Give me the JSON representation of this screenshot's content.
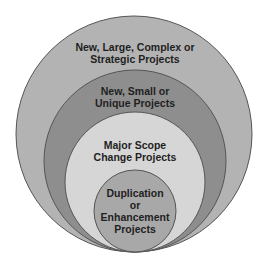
{
  "diagram": {
    "type": "nested-circles",
    "circles": [
      {
        "label_lines": [
          "New, Large, Complex or",
          "Strategic Projects"
        ],
        "fill": "#b3b3b3",
        "cx": 134,
        "cy": 134,
        "r": 118
      },
      {
        "label_lines": [
          "New, Small or",
          "Unique Projects"
        ],
        "fill": "#8e8e8e",
        "cx": 135,
        "cy": 161,
        "r": 91
      },
      {
        "label_lines": [
          "Major Scope",
          "Change Projects"
        ],
        "fill": "#d6d6d6",
        "cx": 135,
        "cy": 182,
        "r": 70
      },
      {
        "label_lines": [
          "Duplication",
          "or",
          "Enhancement",
          "Projects"
        ],
        "fill": "#a8a8a8",
        "cx": 135,
        "cy": 211,
        "r": 41
      }
    ],
    "stroke": "#555555"
  }
}
